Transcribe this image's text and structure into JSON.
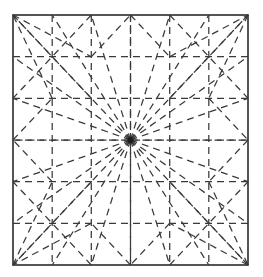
{
  "figure": {
    "background_color": "#ffffff",
    "line_color": "#3a3a3a",
    "border_color": "#2b2b2b",
    "hub_color": "#1d1d1d"
  },
  "chart_data": {
    "type": "diagram",
    "xlabel": "",
    "ylabel": "",
    "xlim": [
      13,
      248
    ],
    "ylim": [
      15,
      265
    ],
    "grid": true,
    "legend": null,
    "square": {
      "left": 13,
      "top": 15,
      "right": 248,
      "bottom": 265,
      "width": 235,
      "height": 250
    },
    "grid_divisions": 6,
    "grid_vertical_x": [
      52.2,
      91.3,
      130.5,
      169.7,
      208.8
    ],
    "grid_horizontal_y": [
      56.7,
      98.3,
      140.0,
      181.7,
      223.3
    ],
    "center_point": [
      130.5,
      140.0
    ],
    "radial_endpoints": [
      [
        13,
        15
      ],
      [
        52.2,
        15
      ],
      [
        91.3,
        15
      ],
      [
        130.5,
        15
      ],
      [
        169.7,
        15
      ],
      [
        208.8,
        15
      ],
      [
        248,
        15
      ],
      [
        248,
        56.7
      ],
      [
        248,
        98.3
      ],
      [
        248,
        140.0
      ],
      [
        248,
        181.7
      ],
      [
        248,
        223.3
      ],
      [
        248,
        265
      ],
      [
        208.8,
        265
      ],
      [
        169.7,
        265
      ],
      [
        130.5,
        265
      ],
      [
        91.3,
        265
      ],
      [
        52.2,
        265
      ],
      [
        13,
        265
      ],
      [
        13,
        223.3
      ],
      [
        13,
        181.7
      ],
      [
        13,
        140.0
      ],
      [
        13,
        98.3
      ],
      [
        13,
        56.7
      ]
    ],
    "star_polyline_outer": [
      [
        13,
        15
      ],
      [
        91.3,
        56.7
      ],
      [
        130.5,
        15
      ],
      [
        169.7,
        56.7
      ],
      [
        248,
        15
      ],
      [
        208.8,
        98.3
      ],
      [
        248,
        140.0
      ],
      [
        208.8,
        181.7
      ],
      [
        248,
        265
      ],
      [
        169.7,
        223.3
      ],
      [
        130.5,
        265
      ],
      [
        91.3,
        223.3
      ],
      [
        13,
        265
      ],
      [
        52.2,
        181.7
      ],
      [
        13,
        140.0
      ],
      [
        52.2,
        98.3
      ],
      [
        13,
        15
      ]
    ],
    "corner_cross_segments": [
      [
        [
          13,
          15
        ],
        [
          91.3,
          98.3
        ]
      ],
      [
        [
          91.3,
          15
        ],
        [
          13,
          98.3
        ]
      ],
      [
        [
          248,
          15
        ],
        [
          169.7,
          98.3
        ]
      ],
      [
        [
          169.7,
          15
        ],
        [
          248,
          98.3
        ]
      ],
      [
        [
          13,
          265
        ],
        [
          91.3,
          181.7
        ]
      ],
      [
        [
          91.3,
          265
        ],
        [
          13,
          181.7
        ]
      ],
      [
        [
          248,
          265
        ],
        [
          169.7,
          181.7
        ]
      ],
      [
        [
          169.7,
          265
        ],
        [
          248,
          181.7
        ]
      ]
    ]
  }
}
